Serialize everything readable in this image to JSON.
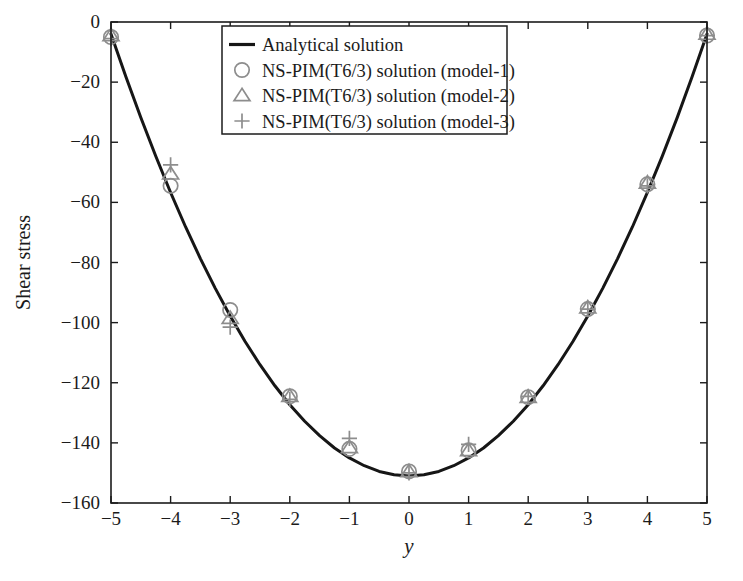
{
  "chart_data": {
    "type": "line",
    "title": "",
    "subtitle": "",
    "xlabel": "y",
    "ylabel": "Shear stress",
    "xlim": [
      -5,
      5
    ],
    "ylim": [
      -160,
      0
    ],
    "xticks": [
      "-5",
      "-4",
      "-3",
      "-2",
      "-1",
      "0",
      "1",
      "2",
      "3",
      "4",
      "5"
    ],
    "xtick_values": [
      -5,
      -4,
      -3,
      -2,
      -1,
      0,
      1,
      2,
      3,
      4,
      5
    ],
    "yticks": [
      "0",
      "-20",
      "-40",
      "-60",
      "-80",
      "-100",
      "-120",
      "-140",
      "-160"
    ],
    "ytick_values": [
      0,
      -20,
      -40,
      -60,
      -80,
      -100,
      -120,
      -140,
      -160
    ],
    "grid": false,
    "legend_position": "upper center",
    "series": [
      {
        "name": "Analytical solution",
        "marker": "line",
        "style": "solid-black-line",
        "color": "#161616",
        "x": [
          -5.0,
          -4.75,
          -4.5,
          -4.25,
          -4.0,
          -3.75,
          -3.5,
          -3.25,
          -3.0,
          -2.75,
          -2.5,
          -2.25,
          -2.0,
          -1.75,
          -1.5,
          -1.25,
          -1.0,
          -0.75,
          -0.5,
          -0.25,
          0.0,
          0.25,
          0.5,
          0.75,
          1.0,
          1.25,
          1.5,
          1.75,
          2.0,
          2.25,
          2.5,
          2.75,
          3.0,
          3.25,
          3.5,
          3.75,
          4.0,
          4.25,
          4.5,
          4.75,
          5.0
        ],
        "values": [
          -4.0,
          -18.2,
          -31.8,
          -44.6,
          -56.7,
          -68.1,
          -78.7,
          -88.6,
          -97.8,
          -106.3,
          -114.0,
          -121.0,
          -127.3,
          -132.8,
          -137.6,
          -141.7,
          -145.0,
          -147.6,
          -149.5,
          -150.6,
          -151.0,
          -150.6,
          -149.5,
          -147.6,
          -145.0,
          -141.7,
          -137.6,
          -132.8,
          -127.3,
          -121.0,
          -114.0,
          -106.3,
          -97.8,
          -88.6,
          -78.7,
          -68.1,
          -56.7,
          -44.6,
          -31.8,
          -18.2,
          -4.0
        ]
      },
      {
        "name": "NS-PIM(T6/3) solution (model-1)",
        "marker": "circle",
        "color": "#8d8d8d",
        "x": [
          -5,
          -4,
          -3,
          -2,
          -1,
          0,
          1,
          2,
          3,
          4,
          5
        ],
        "values": [
          -5.0,
          -54.5,
          -95.8,
          -124.5,
          -142.0,
          -149.5,
          -142.5,
          -124.8,
          -95.5,
          -54.0,
          -4.5
        ]
      },
      {
        "name": "NS-PIM(T6/3) solution (model-2)",
        "marker": "triangle",
        "color": "#8d8d8d",
        "x": [
          -5,
          -4,
          -3,
          -2,
          -1,
          0,
          1,
          2,
          3,
          4,
          5
        ],
        "values": [
          -4.5,
          -50.5,
          -98.5,
          -124.5,
          -141.5,
          -149.5,
          -142.5,
          -124.8,
          -95.0,
          -53.5,
          -4.0
        ]
      },
      {
        "name": "NS-PIM(T6/3) solution (model-3)",
        "marker": "plus",
        "color": "#8d8d8d",
        "x": [
          -5,
          -4,
          -3,
          -2,
          -1,
          0,
          1,
          2,
          3,
          4,
          5
        ],
        "values": [
          -5.5,
          -47.5,
          -101.5,
          -125.5,
          -138.5,
          -150.0,
          -140.5,
          -124.5,
          -95.5,
          -54.5,
          -4.5
        ]
      }
    ]
  },
  "legend": {
    "entries": [
      {
        "label": "Analytical solution",
        "marker": "line"
      },
      {
        "label": "NS-PIM(T6/3) solution (model-1)",
        "marker": "circle"
      },
      {
        "label": "NS-PIM(T6/3) solution (model-2)",
        "marker": "triangle"
      },
      {
        "label": "NS-PIM(T6/3) solution (model-3)",
        "marker": "plus"
      }
    ]
  },
  "colors": {
    "line": "#161616",
    "marker": "#8d8d8d",
    "axis": "#1b1b1b",
    "background": "#ffffff"
  }
}
